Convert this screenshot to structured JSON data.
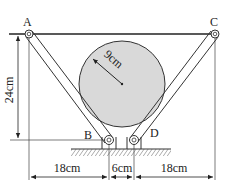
{
  "labels": {
    "A": "A",
    "B": "B",
    "C": "C",
    "D": "D"
  },
  "dimensions": {
    "height": "24cm",
    "radius": "9cm",
    "left_span": "18cm",
    "middle_span": "6cm",
    "right_span": "18cm"
  },
  "colors": {
    "ball_fill": "#d9d9d9",
    "line": "#222222"
  }
}
